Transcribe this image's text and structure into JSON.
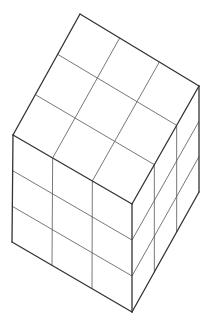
{
  "diagram": {
    "divisions": 3,
    "colors": {
      "background": "#ffffff",
      "line": "#333333"
    },
    "vertices": {
      "top": [
        80,
        14
      ],
      "right": [
        199,
        86
      ],
      "left": [
        13,
        135
      ],
      "front_top": [
        132,
        204
      ],
      "left_bottom": [
        12,
        242
      ],
      "front_bottom": [
        132,
        312
      ],
      "right_bottom": [
        199,
        192
      ]
    }
  }
}
